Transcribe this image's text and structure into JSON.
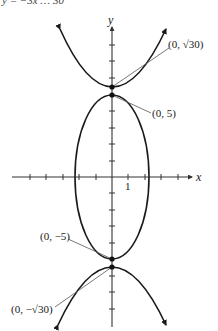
{
  "header": {
    "cutoff_text": "y = −3x …  30"
  },
  "axes": {
    "x_label": "x",
    "y_label": "y",
    "x_tick_label": "1",
    "origin_px": [
      112,
      177
    ],
    "px_per_unit": 16.4,
    "x_ticks": [
      -5,
      -4,
      -3,
      -2,
      -1,
      1,
      2,
      3,
      4
    ],
    "y_ticks": [
      -9,
      -8,
      -7,
      -6,
      -5,
      -4,
      -3,
      -2,
      -1,
      1,
      2,
      3,
      4,
      5,
      6,
      7,
      8
    ]
  },
  "curves": {
    "ellipse": {
      "center": [
        0,
        0
      ],
      "semi_x": 2.236,
      "semi_y": 5
    },
    "upper_parabola": {
      "vertex": [
        0,
        5.477
      ],
      "opens": "up"
    },
    "lower_parabola": {
      "vertex": [
        0,
        -5.477
      ],
      "opens": "down"
    }
  },
  "points": [
    {
      "id": "p1",
      "label": "(0, √30)",
      "x": 0,
      "y": 5.477
    },
    {
      "id": "p2",
      "label": "(0, 5)",
      "x": 0,
      "y": 5
    },
    {
      "id": "p3",
      "label": "(0, −5)",
      "x": 0,
      "y": -5
    },
    {
      "id": "p4",
      "label": "(0, −√30)",
      "x": 0,
      "y": -5.477
    }
  ],
  "labels": {
    "sqrt30_pos": "(0, √30)",
    "five_pos": "(0, 5)",
    "five_neg": "(0, −5)",
    "sqrt30_neg": "(0, −√30)"
  },
  "colors": {
    "curve": "#1a1a1a",
    "axis": "#333333",
    "leader": "#555555"
  }
}
